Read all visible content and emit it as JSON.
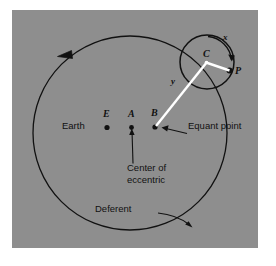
{
  "figure": {
    "kind": "ptolemaic-equant-diagram",
    "panel_color": "#8e8e8e",
    "background_color": "#ffffff",
    "stroke_color": "#111111",
    "highlight_color": "#ffffff"
  },
  "labels": {
    "earth": "Earth",
    "point_e": "E",
    "point_a": "A",
    "point_b": "B",
    "equant_point": "Equant point",
    "center_of_eccentric_line1": "Center of",
    "center_of_eccentric_line2": "eccentric",
    "deferent": "Deferent",
    "epicycle_center": "C",
    "planet": "P",
    "angle_x": "x",
    "angle_y": "y"
  },
  "geometry": {
    "deferent": {
      "cx": 130,
      "cy": 133,
      "r": 97
    },
    "epicycle": {
      "cx": 207,
      "cy": 62,
      "r": 27
    },
    "points": {
      "E": {
        "x": 107,
        "y": 127
      },
      "A": {
        "x": 131,
        "y": 127
      },
      "B": {
        "x": 155,
        "y": 127
      },
      "C": {
        "x": 207,
        "y": 62
      },
      "P": {
        "x": 230,
        "y": 71
      }
    }
  }
}
